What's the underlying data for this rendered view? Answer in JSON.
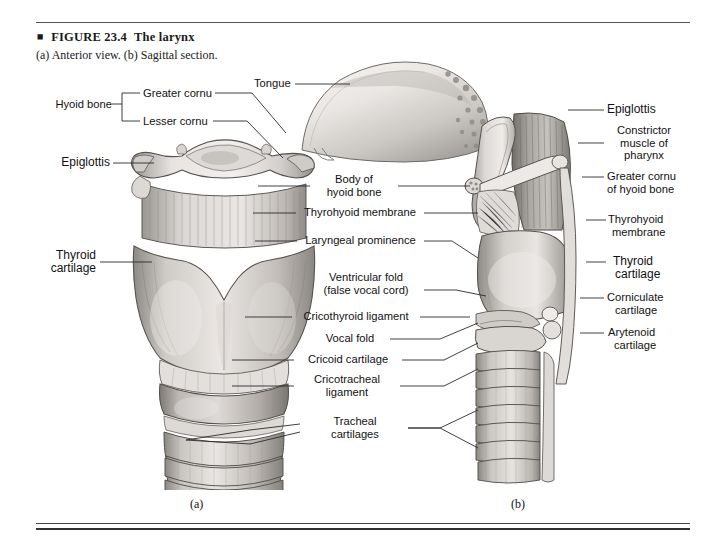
{
  "figure": {
    "diamond_glyph": "◆",
    "number": "FIGURE 23.4",
    "title": "The larynx",
    "subtitle": "(a) Anterior view. (b) Sagittal section."
  },
  "panels": {
    "a": {
      "letter": "(a)",
      "description": "Anterior view"
    },
    "b": {
      "letter": "(b)",
      "description": "Sagittal section"
    }
  },
  "labels": {
    "left": [
      {
        "id": "hyoid-bone",
        "text": "Hyoid bone"
      },
      {
        "id": "greater-cornu",
        "text": "Greater cornu"
      },
      {
        "id": "lesser-cornu",
        "text": "Lesser cornu"
      },
      {
        "id": "epiglottis-left",
        "text": "Epiglottis"
      },
      {
        "id": "thyroid-cartilage-left-1",
        "text": "Thyroid"
      },
      {
        "id": "thyroid-cartilage-left-2",
        "text": "cartilage"
      }
    ],
    "center": [
      {
        "id": "tongue",
        "text": "Tongue"
      },
      {
        "id": "body-of-hyoid-bone-1",
        "text": "Body of"
      },
      {
        "id": "body-of-hyoid-bone-2",
        "text": "hyoid bone"
      },
      {
        "id": "thyrohyoid-membrane-center",
        "text": "Thyrohyoid membrane"
      },
      {
        "id": "laryngeal-prominence",
        "text": "Laryngeal prominence"
      },
      {
        "id": "ventricular-fold-1",
        "text": "Ventricular fold"
      },
      {
        "id": "ventricular-fold-2",
        "text": "(false vocal cord)"
      },
      {
        "id": "cricothyroid-ligament",
        "text": "Cricothyroid ligament"
      },
      {
        "id": "vocal-fold",
        "text": "Vocal fold"
      },
      {
        "id": "cricoid-cartilage",
        "text": "Cricoid cartilage"
      },
      {
        "id": "cricotracheal-ligament-1",
        "text": "Cricotracheal"
      },
      {
        "id": "cricotracheal-ligament-2",
        "text": "ligament"
      },
      {
        "id": "tracheal-cartilages-1",
        "text": "Tracheal"
      },
      {
        "id": "tracheal-cartilages-2",
        "text": "cartilages"
      }
    ],
    "right": [
      {
        "id": "epiglottis-right",
        "text": "Epiglottis"
      },
      {
        "id": "constrictor-muscle-1",
        "text": "Constrictor"
      },
      {
        "id": "constrictor-muscle-2",
        "text": "muscle of"
      },
      {
        "id": "constrictor-muscle-3",
        "text": "pharynx"
      },
      {
        "id": "greater-cornu-hyoid-1",
        "text": "Greater cornu"
      },
      {
        "id": "greater-cornu-hyoid-2",
        "text": "of hyoid bone"
      },
      {
        "id": "thyrohyoid-membrane-right-1",
        "text": "Thyrohyoid"
      },
      {
        "id": "thyrohyoid-membrane-right-2",
        "text": "membrane"
      },
      {
        "id": "thyroid-cartilage-right-1",
        "text": "Thyroid"
      },
      {
        "id": "thyroid-cartilage-right-2",
        "text": "cartilage"
      },
      {
        "id": "corniculate-cartilage-1",
        "text": "Corniculate"
      },
      {
        "id": "corniculate-cartilage-2",
        "text": "cartilage"
      },
      {
        "id": "arytenoid-cartilage-1",
        "text": "Arytenoid"
      },
      {
        "id": "arytenoid-cartilage-2",
        "text": "cartilage"
      }
    ]
  },
  "colors": {
    "text": "#111111",
    "rule": "#444444",
    "leader": "#2a2a2a",
    "art_light": "#e8e6e3",
    "art_mid": "#b8b4b0",
    "art_dark": "#7d7975",
    "art_outline": "#4a4744",
    "background": "#ffffff"
  }
}
